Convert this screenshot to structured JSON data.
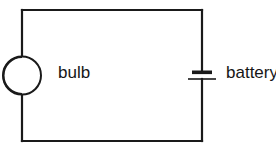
{
  "diagram": {
    "type": "electrical-circuit-schematic",
    "background_color": "#ffffff",
    "line_color": "#1a1a1a",
    "components": [
      {
        "id": "bulb",
        "label": "bulb",
        "symbol": "lamp-circle-with-arc",
        "position": "left-side",
        "center_x": 22,
        "center_y": 75,
        "radius": 19
      },
      {
        "id": "battery",
        "label": "battery",
        "symbol": "battery-cell-two-plates",
        "position": "right-side",
        "center_x": 202,
        "center_y": 75
      }
    ],
    "wires": {
      "left_x": 22,
      "right_x": 202,
      "top_y": 10,
      "bottom_y": 141
    },
    "labels": {
      "bulb": "bulb",
      "battery": "battery"
    }
  }
}
